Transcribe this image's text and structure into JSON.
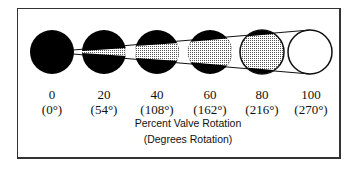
{
  "figure": {
    "positions": [
      {
        "percent": "0",
        "degrees": "(0°)",
        "open_fraction": 0.0
      },
      {
        "percent": "20",
        "degrees": "(54°)",
        "open_fraction": 0.2
      },
      {
        "percent": "40",
        "degrees": "(108°)",
        "open_fraction": 0.4
      },
      {
        "percent": "60",
        "degrees": "(162°)",
        "open_fraction": 0.6
      },
      {
        "percent": "80",
        "degrees": "(216°)",
        "open_fraction": 0.8
      },
      {
        "percent": "100",
        "degrees": "(270°)",
        "open_fraction": 1.0
      }
    ],
    "caption_line1": "Percent Valve Rotation",
    "caption_line2": "(Degrees Rotation)",
    "colors": {
      "closed": "#000000",
      "open_shade": "#c8c8c8",
      "outline": "#111111"
    }
  }
}
